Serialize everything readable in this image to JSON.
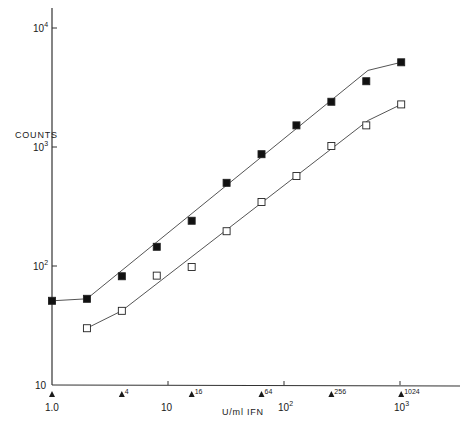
{
  "chart_data": {
    "type": "scatter",
    "title": "",
    "xlabel": "U/ml IFN",
    "ylabel": "COUNTS",
    "xscale": "log",
    "yscale": "log",
    "xlim": [
      1.0,
      1800
    ],
    "ylim": [
      10,
      14000
    ],
    "grid": false,
    "legend": null,
    "x_ticks": [
      {
        "value": 1,
        "label": "1.0",
        "sup": ""
      },
      {
        "value": 10,
        "label": "10",
        "sup": ""
      },
      {
        "value": 100,
        "label": "10",
        "sup": "2"
      },
      {
        "value": 1000,
        "label": "10",
        "sup": "3"
      }
    ],
    "y_ticks": [
      {
        "value": 10,
        "label": "10",
        "sup": ""
      },
      {
        "value": 100,
        "label": "10",
        "sup": "2"
      },
      {
        "value": 1000,
        "label": "10",
        "sup": "3"
      },
      {
        "value": 10000,
        "label": "10",
        "sup": "4"
      }
    ],
    "dose_markers": [
      {
        "value": 1,
        "label": ""
      },
      {
        "value": 4,
        "label": "4"
      },
      {
        "value": 16,
        "label": "16"
      },
      {
        "value": 64,
        "label": "64"
      },
      {
        "value": 256,
        "label": "256"
      },
      {
        "value": 1024,
        "label": "1024"
      }
    ],
    "series": [
      {
        "name": "filled squares",
        "marker": "filled-square",
        "x": [
          1,
          2,
          4,
          8,
          16,
          32,
          64,
          128,
          256,
          512,
          1024
        ],
        "y": [
          51,
          53,
          82,
          145,
          240,
          500,
          870,
          1520,
          2400,
          3570,
          5150
        ],
        "fit_line": {
          "x": [
            1,
            2,
            530,
            1024
          ],
          "y": [
            51,
            53,
            4400,
            5150
          ]
        }
      },
      {
        "name": "open squares",
        "marker": "open-square",
        "x": [
          2,
          4,
          8,
          16,
          32,
          64,
          128,
          256,
          512,
          1024
        ],
        "y": [
          30,
          42,
          83,
          98,
          196,
          345,
          570,
          1020,
          1520,
          2280
        ],
        "fit_line": {
          "x": [
            2,
            4,
            530,
            1024
          ],
          "y": [
            30,
            42,
            1670,
            2280
          ]
        }
      }
    ],
    "annotations": [
      "Dose triangles below x-axis: 4, 16, 64, 256, 1024"
    ]
  },
  "labels": {
    "y_axis": "COUNTS",
    "x_axis": "U/ml IFN"
  }
}
